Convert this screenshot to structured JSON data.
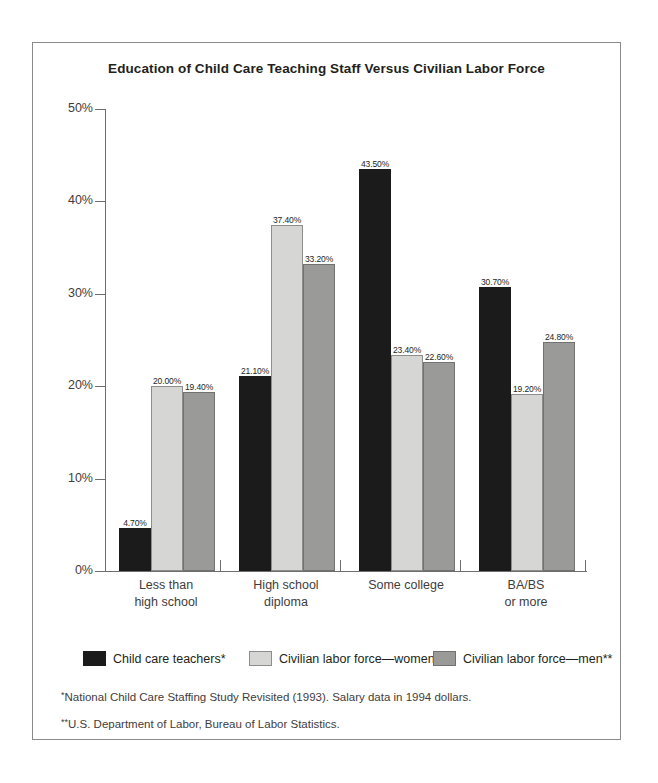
{
  "chart_data": {
    "type": "bar",
    "title": "Education of Child Care Teaching Staff Versus Civilian Labor Force",
    "xlabel": "",
    "ylabel": "",
    "ylim": [
      0,
      50
    ],
    "ytick_labels": [
      "50%",
      "40%",
      "30%",
      "20%",
      "10%",
      "0%"
    ],
    "ytick_values": [
      50,
      40,
      30,
      20,
      10,
      0
    ],
    "grid": false,
    "legend_position": "bottom",
    "categories": [
      "Less than\nhigh school",
      "High school\ndiploma",
      "Some college",
      "BA/BS\nor more"
    ],
    "category_lines": [
      [
        "Less than",
        "high school"
      ],
      [
        "High school",
        "diploma"
      ],
      [
        "Some college"
      ],
      [
        "BA/BS",
        "or more"
      ]
    ],
    "series": [
      {
        "name": "Child care teachers*",
        "color": "#1b1b1b",
        "values": [
          4.7,
          21.1,
          43.5,
          30.7
        ],
        "labels": [
          "4.70%",
          "21.10%",
          "43.50%",
          "30.70%"
        ]
      },
      {
        "name": "Civilian labor force—women**",
        "color": "#d6d6d4",
        "values": [
          20.0,
          37.4,
          23.4,
          19.2
        ],
        "labels": [
          "20.00%",
          "37.40%",
          "23.40%",
          "19.20%"
        ]
      },
      {
        "name": "Civilian labor force—men**",
        "color": "#9a9a99",
        "values": [
          19.4,
          33.2,
          22.6,
          24.8
        ],
        "labels": [
          "19.40%",
          "33.20%",
          "22.60%",
          "24.80%"
        ]
      }
    ]
  },
  "footnotes": [
    {
      "marker": "*",
      "text": "National Child Care Staffing Study Revisited (1993). Salary data in 1994 dollars."
    },
    {
      "marker": "**",
      "text": "U.S. Department of Labor, Bureau of Labor Statistics."
    }
  ]
}
